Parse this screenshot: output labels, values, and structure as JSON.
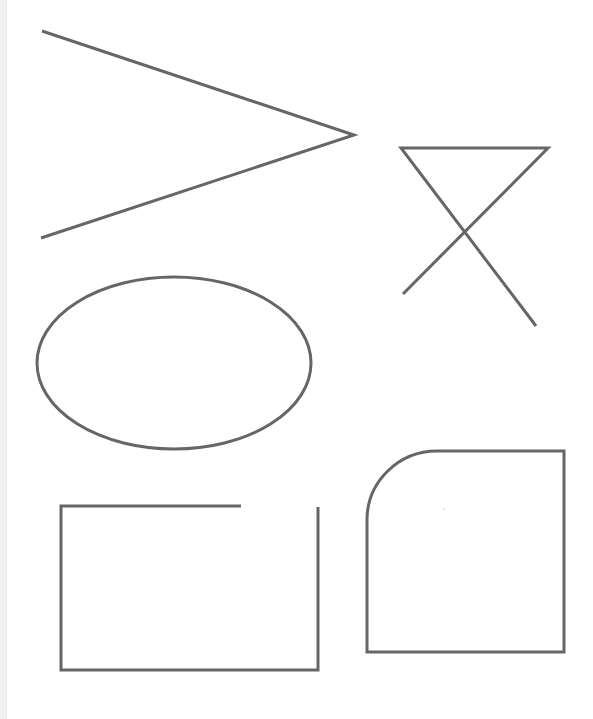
{
  "canvas": {
    "width": 593,
    "height": 719,
    "background": "#ffffff",
    "stroke_color": "#666666",
    "stroke_width": 3
  },
  "shapes": {
    "angle": {
      "type": "polyline",
      "points": "42,31 354,135 41,238"
    },
    "crossed_triangle": {
      "type": "polyline",
      "points": "403,294 548,148 401,148 536,326"
    },
    "ellipse": {
      "type": "ellipse",
      "cx": 174,
      "cy": 363,
      "rx": 137,
      "ry": 86
    },
    "open_rectangle": {
      "type": "polyline",
      "points": "241,506 61,506 61,670 318,670 318,507"
    },
    "rounded_corner_square": {
      "type": "path",
      "d": "M367,652 L367,520 A70,69 0 0 1 437,451 L564,451 L564,652 Z"
    },
    "stray_dot": {
      "type": "circle",
      "cx": 444,
      "cy": 509,
      "r": 0.8,
      "fill": "#cccccc"
    }
  }
}
